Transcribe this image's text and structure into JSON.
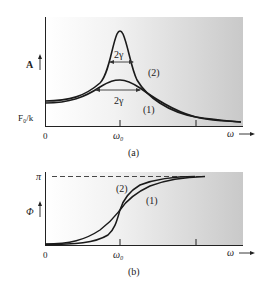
{
  "figure": {
    "panel_a": {
      "caption": "(a)",
      "y_axis_label": "A",
      "y_reference_label": "F₀/k",
      "x_origin_label": "0",
      "x_tick_label": "ω₀",
      "x_axis_label": "ω",
      "width_label_upper": "2γ",
      "width_label_lower": "2γ",
      "curve_labels": [
        "(2)",
        "(1)"
      ]
    },
    "panel_b": {
      "caption": "(b)",
      "y_axis_label": "Φ",
      "y_max_label": "π",
      "x_origin_label": "0",
      "x_tick_label": "ω₀",
      "x_axis_label": "ω",
      "curve_labels": [
        "(2)",
        "(1)"
      ]
    },
    "colors": {
      "curve": "#1a1a1a",
      "background_left": "#ffffff",
      "background_right": "#cfcfcf"
    }
  }
}
